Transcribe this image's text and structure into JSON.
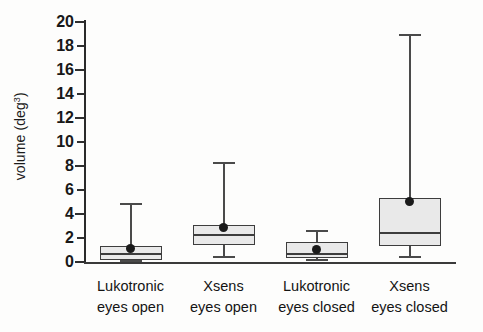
{
  "chart_data": {
    "type": "boxplot",
    "title": "",
    "xlabel": "",
    "ylabel": "volume (deg³)",
    "ylabel_base": "volume (deg",
    "ylabel_sup": "3",
    "ylabel_close": ")",
    "ylim": [
      0,
      20
    ],
    "ytick_step": 2,
    "yticks": [
      0,
      2,
      4,
      6,
      8,
      10,
      12,
      14,
      16,
      18,
      20
    ],
    "ytick_labels": [
      "0",
      "2",
      "4",
      "6",
      "8",
      "10",
      "12",
      "14",
      "16",
      "18",
      "20"
    ],
    "grid": false,
    "legend": null,
    "categories": [
      "Lukotronic eyes open",
      "Xsens eyes open",
      "Lukotronic eyes closed",
      "Xsens eyes closed"
    ],
    "category_lines": [
      {
        "line1": "Lukotronic",
        "line2": "eyes open"
      },
      {
        "line1": "Xsens",
        "line2": "eyes open"
      },
      {
        "line1": "Lukotronic",
        "line2": "eyes closed"
      },
      {
        "line1": "Xsens",
        "line2": "eyes closed"
      }
    ],
    "boxes": [
      {
        "name": "Lukotronic eyes open",
        "whisker_low": 0.0,
        "q1": 0.2,
        "median": 0.55,
        "q3": 1.3,
        "whisker_high": 4.75,
        "mean": 1.15
      },
      {
        "name": "Xsens eyes open",
        "whisker_low": 0.3,
        "q1": 1.4,
        "median": 2.2,
        "q3": 3.05,
        "whisker_high": 8.15,
        "mean": 2.9
      },
      {
        "name": "Lukotronic eyes closed",
        "whisker_low": 0.05,
        "q1": 0.35,
        "median": 0.6,
        "q3": 1.65,
        "whisker_high": 2.5,
        "mean": 1.05
      },
      {
        "name": "Xsens eyes closed",
        "whisker_low": 0.35,
        "q1": 1.3,
        "median": 2.3,
        "q3": 5.3,
        "whisker_high": 18.85,
        "mean": 5.05
      }
    ],
    "box_fill_color": "#e9e9e9",
    "box_edge_color": "#3d3d3d",
    "whisker_color": "#4a4a4a",
    "mean_marker_color": "#1a1a1a",
    "mean_marker_shape": "diamond",
    "axis_color": "#2a2a2a",
    "background_color": "#fdfdfc"
  }
}
